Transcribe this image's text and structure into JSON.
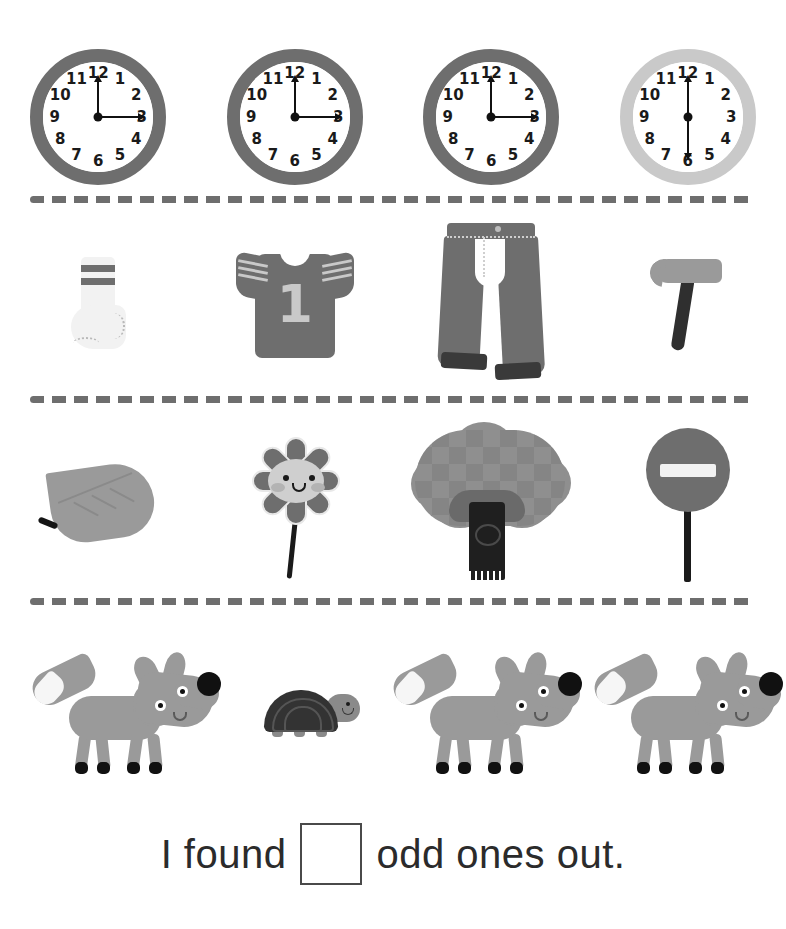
{
  "worksheet": {
    "title": "Odd One Out",
    "answer_sentence": {
      "before_text": "I found",
      "after_text": "odd ones out.",
      "answer_value": ""
    }
  },
  "rows": [
    {
      "name": "clocks-row",
      "items": [
        {
          "label": "clock-three-oclock",
          "numerals": [
            "12",
            "1",
            "2",
            "3",
            "4",
            "5",
            "6",
            "7",
            "8",
            "9",
            "10",
            "11"
          ],
          "rim_color": "#6e6e6e",
          "hands": "12-and-3",
          "odd": false
        },
        {
          "label": "clock-three-oclock",
          "numerals": [
            "12",
            "1",
            "2",
            "3",
            "4",
            "5",
            "6",
            "7",
            "8",
            "9",
            "10",
            "11"
          ],
          "rim_color": "#6e6e6e",
          "hands": "12-and-3",
          "odd": false
        },
        {
          "label": "clock-three-oclock",
          "numerals": [
            "12",
            "1",
            "2",
            "3",
            "4",
            "5",
            "6",
            "7",
            "8",
            "9",
            "10",
            "11"
          ],
          "rim_color": "#6e6e6e",
          "hands": "12-and-3",
          "odd": false
        },
        {
          "label": "clock-six-thirty-light",
          "numerals": [
            "12",
            "1",
            "2",
            "3",
            "4",
            "5",
            "6",
            "7",
            "8",
            "9",
            "10",
            "11"
          ],
          "rim_color": "#c9c9c9",
          "hands": "12-and-6",
          "odd": true
        }
      ]
    },
    {
      "name": "clothing-row",
      "items": [
        {
          "label": "sock",
          "odd": false
        },
        {
          "label": "t-shirt",
          "jersey_number": "1",
          "odd": false
        },
        {
          "label": "jeans",
          "odd": false
        },
        {
          "label": "hammer",
          "odd": true
        }
      ]
    },
    {
      "name": "nature-row",
      "items": [
        {
          "label": "leaf",
          "odd": false
        },
        {
          "label": "flower",
          "odd": false
        },
        {
          "label": "tree",
          "odd": false
        },
        {
          "label": "no-entry-sign",
          "odd": true
        }
      ]
    },
    {
      "name": "animals-row",
      "items": [
        {
          "label": "fox",
          "odd": false
        },
        {
          "label": "turtle",
          "odd": true
        },
        {
          "label": "fox",
          "odd": false
        },
        {
          "label": "fox",
          "odd": false
        }
      ]
    }
  ],
  "colors": {
    "dark_gray": "#6e6e6e",
    "light_gray": "#c9c9c9",
    "mid_gray": "#9a9a9a",
    "near_black": "#1a1a1a",
    "divider": "#6e6e6e",
    "background": "#ffffff"
  }
}
